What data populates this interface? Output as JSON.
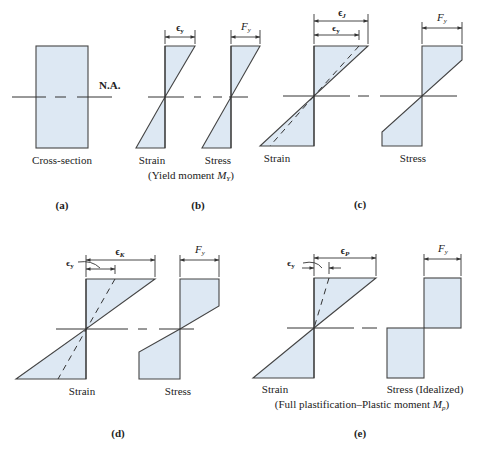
{
  "panels": {
    "a": {
      "letter": "(a)",
      "cross_section_label": "Cross-section",
      "neutral_axis_label": "N.A."
    },
    "b": {
      "letter": "(b)",
      "strain_label": "Strain",
      "stress_label": "Stress",
      "caption_prefix": "(Yield moment ",
      "caption_symbol": "M",
      "caption_sub": "Y",
      "caption_suffix": ")",
      "strain_dim": "ϵ",
      "strain_dim_sub": "y",
      "stress_dim": "F",
      "stress_dim_sub": "y"
    },
    "c": {
      "letter": "(c)",
      "strain_label": "Strain",
      "stress_label": "Stress",
      "strain_dim_outer": "ϵ",
      "strain_dim_outer_sub": "J",
      "strain_dim_inner": "ϵ",
      "strain_dim_inner_sub": "y",
      "stress_dim": "F",
      "stress_dim_sub": "y"
    },
    "d": {
      "letter": "(d)",
      "strain_label": "Strain",
      "stress_label": "Stress",
      "strain_dim_outer": "ϵ",
      "strain_dim_outer_sub": "K",
      "strain_dim_inner": "ϵ",
      "strain_dim_inner_sub": "y",
      "stress_dim": "F",
      "stress_dim_sub": "y"
    },
    "e": {
      "letter": "(e)",
      "strain_label": "Strain",
      "stress_label": "Stress (Idealized)",
      "caption_prefix": "(Full plastification–Plastic moment ",
      "caption_symbol": "M",
      "caption_sub": "p",
      "caption_suffix": ")",
      "strain_dim_outer": "ϵ",
      "strain_dim_outer_sub": "P",
      "strain_dim_inner": "ϵ",
      "strain_dim_inner_sub": "y",
      "stress_dim": "F",
      "stress_dim_sub": "y"
    }
  },
  "colors": {
    "fill": "#dde8f3",
    "stroke": "#444444"
  }
}
